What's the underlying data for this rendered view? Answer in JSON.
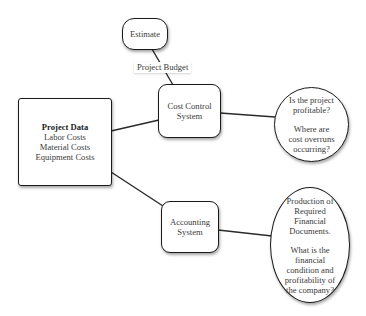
{
  "diagram": {
    "type": "flow",
    "nodes": {
      "estimate": {
        "label": "Estimate"
      },
      "project_data": {
        "title": "Project Data",
        "items": [
          "Labor Costs",
          "Material Costs",
          "Equipment Costs"
        ]
      },
      "cost_control": {
        "lines": [
          "Cost Control",
          "System"
        ]
      },
      "accounting": {
        "lines": [
          "Accounting",
          "System"
        ]
      },
      "cost_questions": {
        "para1": [
          "Is the project",
          "profitable?"
        ],
        "para2": [
          "Where are",
          "cost overruns",
          "occurring?"
        ]
      },
      "accounting_outputs": {
        "para1": [
          "Production of",
          "Required",
          "Financial",
          "Documents."
        ],
        "para2": [
          "What is the",
          "financial",
          "condition and",
          "profitability of",
          "the company?"
        ]
      }
    },
    "edges": [
      {
        "from": "estimate",
        "to": "cost_control",
        "label": "Project Budget"
      },
      {
        "from": "project_data",
        "to": "cost_control",
        "label": ""
      },
      {
        "from": "project_data",
        "to": "accounting",
        "label": ""
      },
      {
        "from": "cost_control",
        "to": "cost_questions",
        "label": ""
      },
      {
        "from": "accounting",
        "to": "accounting_outputs",
        "label": ""
      }
    ],
    "colors": {
      "stroke": "#1a1a1a",
      "text": "#3a3a3a",
      "background": "#ffffff"
    }
  }
}
